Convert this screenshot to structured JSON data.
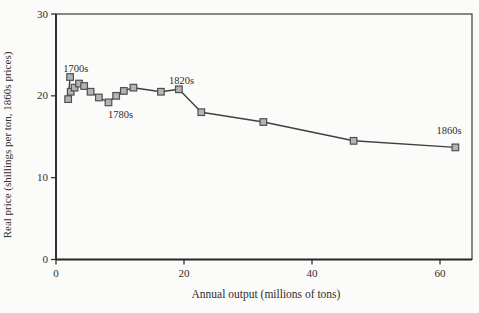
{
  "figure": {
    "background": "#fbfbf9"
  },
  "chart_data": {
    "type": "line",
    "title": "",
    "xlabel": "Annual output (millions of tons)",
    "ylabel": "Real price (shillings per ton, 1860s prices)",
    "xlim": [
      0,
      65
    ],
    "ylim": [
      0,
      30
    ],
    "xticks": [
      0,
      20,
      40,
      60
    ],
    "yticks": [
      0,
      10,
      20,
      30
    ],
    "grid": false,
    "legend": "none",
    "series": [
      {
        "name": "real-price-by-decade",
        "marker": "square",
        "points": [
          {
            "x": 2.2,
            "y": 22.3
          },
          {
            "x": 1.9,
            "y": 19.6
          },
          {
            "x": 2.3,
            "y": 20.5
          },
          {
            "x": 2.9,
            "y": 21.0
          },
          {
            "x": 3.6,
            "y": 21.5
          },
          {
            "x": 4.4,
            "y": 21.2
          },
          {
            "x": 5.4,
            "y": 20.5
          },
          {
            "x": 6.7,
            "y": 19.8
          },
          {
            "x": 8.2,
            "y": 19.2
          },
          {
            "x": 9.4,
            "y": 20.0
          },
          {
            "x": 10.6,
            "y": 20.6
          },
          {
            "x": 12.1,
            "y": 21.0
          },
          {
            "x": 16.4,
            "y": 20.5
          },
          {
            "x": 19.2,
            "y": 20.8
          },
          {
            "x": 22.7,
            "y": 18.0
          },
          {
            "x": 32.4,
            "y": 16.8
          },
          {
            "x": 46.5,
            "y": 14.5
          },
          {
            "x": 62.4,
            "y": 13.7
          }
        ]
      }
    ],
    "annotations": [
      {
        "label": "1700s",
        "x": 3.1,
        "y": 23.4
      },
      {
        "label": "1780s",
        "x": 10.1,
        "y": 17.7
      },
      {
        "label": "1820s",
        "x": 19.6,
        "y": 21.9
      },
      {
        "label": "1860s",
        "x": 61.4,
        "y": 15.8
      }
    ],
    "colors": {
      "line": "#3f3f3f",
      "marker_fill": "#b4b4b4",
      "marker_stroke": "#4f4f4f",
      "axis": "#2a2a2a",
      "text": "#2e2e2e"
    }
  }
}
